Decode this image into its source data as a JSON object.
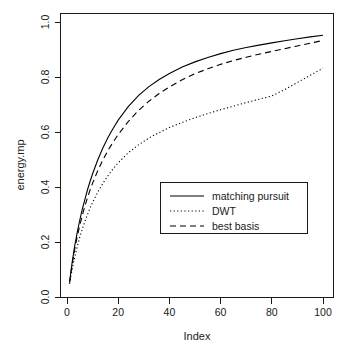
{
  "chart_data": {
    "type": "line",
    "title": "",
    "xlabel": "Index",
    "ylabel": "energy.mp",
    "xlim": [
      1,
      100
    ],
    "ylim": [
      0.0,
      1.0
    ],
    "grid": false,
    "legend_position": "center-right-inside",
    "x_ticks": [
      0,
      20,
      40,
      60,
      80,
      100
    ],
    "x_tick_labels": [
      "0",
      "20",
      "40",
      "60",
      "80",
      "100"
    ],
    "y_ticks": [
      0.0,
      0.2,
      0.4,
      0.6,
      0.8,
      1.0
    ],
    "y_tick_labels": [
      "0.0",
      "0.2",
      "0.4",
      "0.6",
      "0.8",
      "1.0"
    ],
    "x": [
      1,
      2,
      3,
      4,
      5,
      6,
      7,
      8,
      9,
      10,
      12,
      14,
      16,
      18,
      20,
      24,
      28,
      32,
      36,
      40,
      45,
      50,
      55,
      60,
      65,
      70,
      75,
      80,
      85,
      90,
      95,
      100
    ],
    "series": [
      {
        "name": "matching pursuit",
        "style": "solid",
        "color": "#000000",
        "values": [
          0.055,
          0.125,
          0.185,
          0.235,
          0.28,
          0.32,
          0.355,
          0.39,
          0.42,
          0.448,
          0.498,
          0.542,
          0.58,
          0.613,
          0.643,
          0.693,
          0.733,
          0.765,
          0.791,
          0.813,
          0.836,
          0.855,
          0.871,
          0.885,
          0.897,
          0.907,
          0.916,
          0.924,
          0.932,
          0.939,
          0.946,
          0.952
        ]
      },
      {
        "name": "DWT",
        "style": "dotted",
        "color": "#000000",
        "values": [
          0.048,
          0.1,
          0.145,
          0.183,
          0.218,
          0.248,
          0.275,
          0.3,
          0.323,
          0.344,
          0.381,
          0.413,
          0.441,
          0.466,
          0.488,
          0.525,
          0.554,
          0.578,
          0.598,
          0.616,
          0.635,
          0.652,
          0.667,
          0.681,
          0.694,
          0.707,
          0.719,
          0.731,
          0.754,
          0.78,
          0.806,
          0.832
        ]
      },
      {
        "name": "best basis",
        "style": "dashed",
        "color": "#000000",
        "values": [
          0.052,
          0.118,
          0.173,
          0.22,
          0.261,
          0.298,
          0.331,
          0.361,
          0.389,
          0.414,
          0.459,
          0.498,
          0.533,
          0.563,
          0.591,
          0.639,
          0.679,
          0.712,
          0.74,
          0.764,
          0.79,
          0.812,
          0.83,
          0.846,
          0.86,
          0.872,
          0.883,
          0.893,
          0.903,
          0.913,
          0.923,
          0.933
        ]
      }
    ]
  },
  "legend": {
    "entries": [
      {
        "label": "matching pursuit",
        "style": "solid"
      },
      {
        "label": "DWT",
        "style": "dotted"
      },
      {
        "label": "best basis",
        "style": "dashed"
      }
    ]
  }
}
